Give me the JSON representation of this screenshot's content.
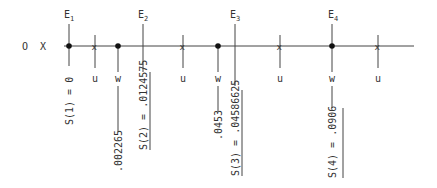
{
  "diagram": {
    "left_labels": {
      "origin": "O",
      "axis": "X"
    },
    "events": [
      {
        "label": "E",
        "subscript": "1",
        "value_label": "S(1) = 0"
      },
      {
        "label": "E",
        "subscript": "2",
        "value_label": "S(2) = .0124575"
      },
      {
        "label": "E",
        "subscript": "3",
        "value_label": "S(3) = .04586625"
      },
      {
        "label": "E",
        "subscript": "4",
        "value_label": "S(4) = .0906"
      }
    ],
    "u_label": "u",
    "w_label": "w",
    "w_values": [
      ".002265",
      ".0453"
    ],
    "colors": {
      "ink": "#333333",
      "background": "#ffffff"
    }
  }
}
